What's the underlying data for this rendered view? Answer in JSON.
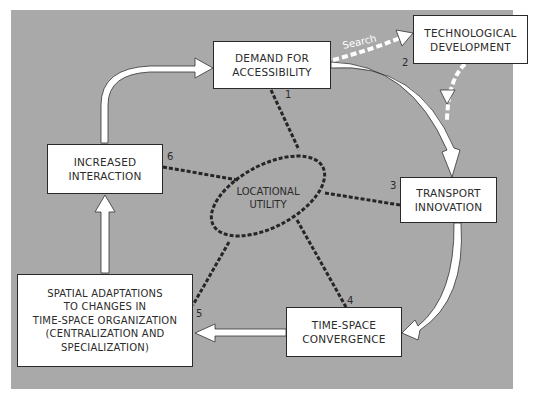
{
  "diagram": {
    "nodes": [
      {
        "id": "demand",
        "label": "DEMAND FOR\nACCESSIBILITY"
      },
      {
        "id": "tech",
        "label": "TECHNOLOGICAL\nDEVELOPMENT"
      },
      {
        "id": "transport",
        "label": "TRANSPORT\nINNOVATION"
      },
      {
        "id": "convergence",
        "label": "TIME-SPACE\nCONVERGENCE"
      },
      {
        "id": "spatial",
        "label": "SPATIAL ADAPTATIONS\nTO CHANGES  IN\nTIME-SPACE ORGANIZATION\n(CENTRALIZATION AND\nSPECIALIZATION)"
      },
      {
        "id": "interaction",
        "label": "INCREASED\nINTERACTION"
      }
    ],
    "center": {
      "label": "LOCATIONAL\nUTILITY"
    },
    "edge_labels": {
      "search": "Search"
    },
    "link_numbers": [
      "1",
      "2",
      "3",
      "4",
      "5",
      "6"
    ],
    "colors": {
      "background": "#a9a9a9",
      "box": "#ffffff",
      "dash": "#2a2a2a",
      "arrow": "#ffffff"
    }
  }
}
